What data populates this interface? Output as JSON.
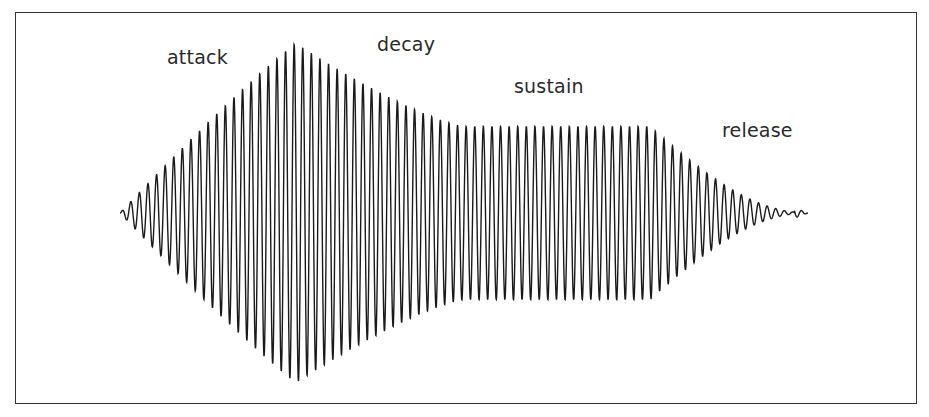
{
  "diagram": {
    "labels": {
      "attack": "attack",
      "decay": "decay",
      "sustain": "sustain",
      "release": "release"
    },
    "waveform_color": "#1a1a1a",
    "frame_color": "#333333",
    "envelope": {
      "cycles_total": 80,
      "stages": [
        {
          "name": "attack",
          "start": 0.0,
          "end": 0.255,
          "from_level": 0.0,
          "to_level": 1.0
        },
        {
          "name": "decay",
          "start": 0.255,
          "end": 0.5,
          "from_level": 1.0,
          "to_level": 0.51
        },
        {
          "name": "sustain",
          "start": 0.5,
          "end": 0.77,
          "from_level": 0.51,
          "to_level": 0.51
        },
        {
          "name": "release",
          "start": 0.77,
          "end": 1.0,
          "from_level": 0.51,
          "to_level": 0.0
        }
      ]
    }
  }
}
